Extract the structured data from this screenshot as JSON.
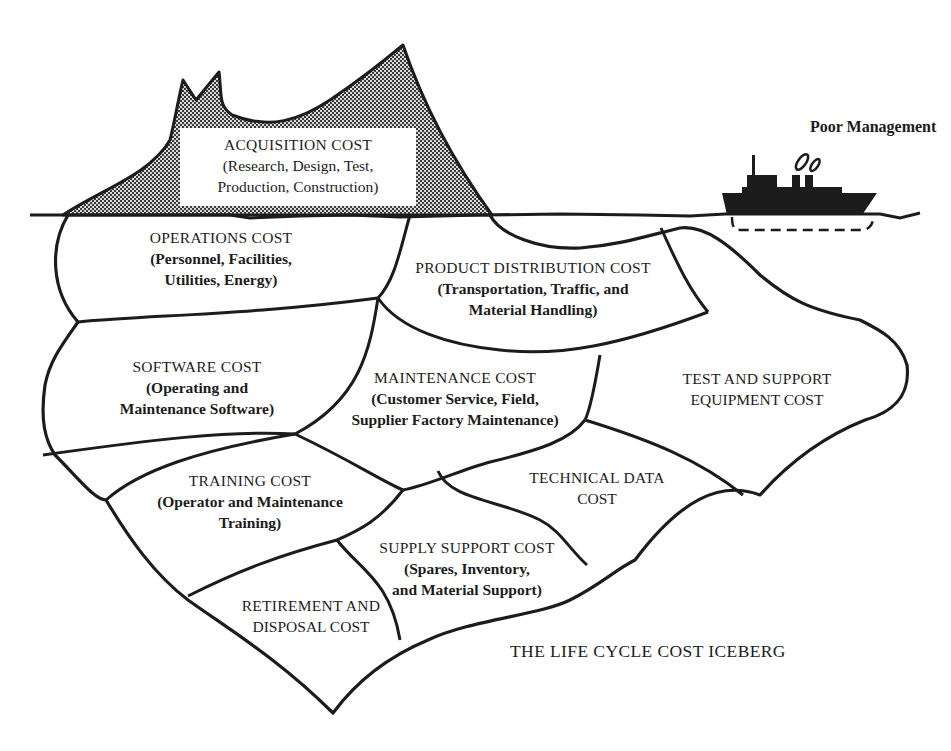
{
  "diagram": {
    "title": "THE LIFE CYCLE COST ICEBERG",
    "ship_label": "Poor Management",
    "above_water": {
      "title": "ACQUISITION COST",
      "lines": [
        "(Research, Design, Test,",
        "Production, Construction)"
      ]
    },
    "regions": [
      {
        "title": "OPERATIONS COST",
        "lines": [
          "(Personnel, Facilities,",
          "Utilities, Energy)"
        ]
      },
      {
        "title": "PRODUCT DISTRIBUTION COST",
        "lines": [
          "(Transportation, Traffic, and",
          "Material Handling)"
        ]
      },
      {
        "title": "SOFTWARE COST",
        "lines": [
          "(Operating and",
          "Maintenance Software)"
        ]
      },
      {
        "title": "MAINTENANCE COST",
        "lines": [
          "(Customer Service, Field,",
          "Supplier Factory Maintenance)"
        ]
      },
      {
        "title": "TEST AND SUPPORT",
        "lines": [
          "EQUIPMENT COST"
        ]
      },
      {
        "title": "TRAINING COST",
        "lines": [
          "(Operator and Maintenance",
          "Training)"
        ]
      },
      {
        "title": "TECHNICAL DATA",
        "lines": [
          "COST"
        ]
      },
      {
        "title": "SUPPLY SUPPORT COST",
        "lines": [
          "(Spares, Inventory,",
          "and Material Support)"
        ]
      },
      {
        "title": "RETIREMENT AND",
        "lines": [
          "DISPOSAL COST"
        ]
      }
    ],
    "colors": {
      "ink": "#1c1c1c",
      "background": "#ffffff",
      "stipple": "#6a6a6a"
    }
  }
}
